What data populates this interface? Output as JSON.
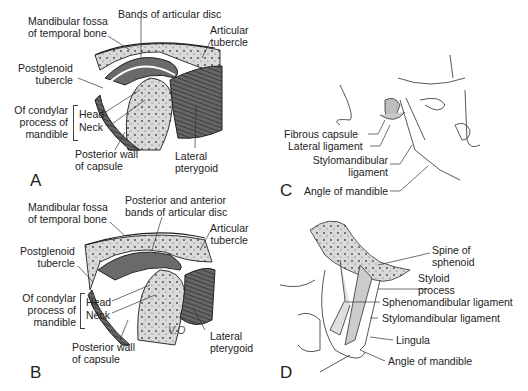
{
  "panels": {
    "A": {
      "letter": "A",
      "labels": {
        "mandibular_fossa_1": "Mandibular fossa",
        "mandibular_fossa_2": "of temporal bone",
        "bands": "Bands of articular disc",
        "articular_1": "Articular",
        "articular_2": "tubercle",
        "postglenoid_1": "Postglenoid",
        "postglenoid_2": "tubercle",
        "condylar_1": "Of condylar",
        "condylar_2": "process of",
        "condylar_3": "mandible",
        "head": "Head",
        "neck": "Neck",
        "posterior_wall_1": "Posterior wall",
        "posterior_wall_2": "of capsule",
        "lateral_pterygoid_1": "Lateral",
        "lateral_pterygoid_2": "pterygoid"
      }
    },
    "B": {
      "letter": "B",
      "labels": {
        "mandibular_fossa_1": "Mandibular fossa",
        "mandibular_fossa_2": "of temporal bone",
        "bands_1": "Posterior and anterior",
        "bands_2": "bands of articular disc",
        "articular_1": "Articular",
        "articular_2": "tubercle",
        "postglenoid_1": "Postglenoid",
        "postglenoid_2": "tubercle",
        "condylar_1": "Of condylar",
        "condylar_2": "process of",
        "condylar_3": "mandible",
        "head": "Head",
        "neck": "Neck",
        "posterior_wall_1": "Posterior wall",
        "posterior_wall_2": "of capsule",
        "lateral_pterygoid_1": "Lateral",
        "lateral_pterygoid_2": "pterygoid",
        "signature": "V.O"
      }
    },
    "C": {
      "letter": "C",
      "labels": {
        "fibrous_capsule": "Fibrous capsule",
        "lateral_ligament": "Lateral ligament",
        "stylomandibular_1": "Stylomandibular",
        "stylomandibular_2": "ligament",
        "angle": "Angle of mandible"
      }
    },
    "D": {
      "letter": "D",
      "labels": {
        "spine_1": "Spine of",
        "spine_2": "sphenoid",
        "styloid_1": "Styloid",
        "styloid_2": "process",
        "sphenomandibular": "Sphenomandibular ligament",
        "stylomandibular": "Stylomandibular ligament",
        "lingula": "Lingula",
        "angle": "Angle of mandible"
      }
    }
  },
  "colors": {
    "bone": "#d8d8d8",
    "muscle": "#555555",
    "line": "#333333",
    "text": "#222222"
  }
}
